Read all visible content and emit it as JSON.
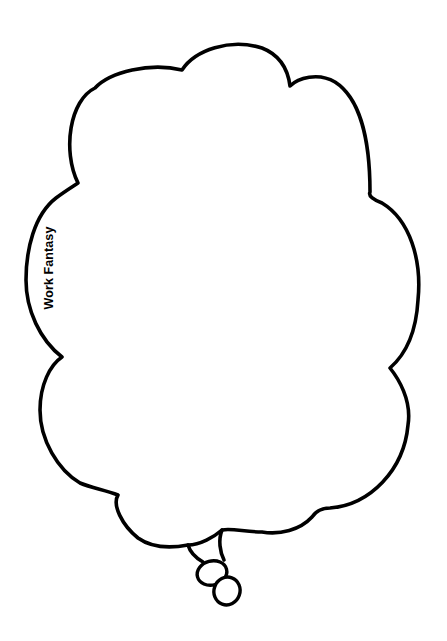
{
  "caption": {
    "text": "Work Fantasy",
    "orientation": "rotated -90deg"
  },
  "graphic": {
    "type": "thought-bubble",
    "outline_color": "#000000",
    "fill_color": "#ffffff",
    "tail_bubbles": 2
  }
}
